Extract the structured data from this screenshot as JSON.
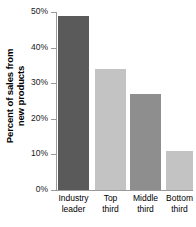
{
  "chart_data": {
    "type": "bar",
    "title": "",
    "subtitle": "",
    "xlabel": "",
    "ylabel": "Percent of sales from new products",
    "ylabel_lines": [
      "Percent of sales from",
      "new products"
    ],
    "categories": [
      "Industry leader",
      "Top third",
      "Middle third",
      "Bottom third"
    ],
    "category_lines": [
      [
        "Industry",
        "leader"
      ],
      [
        "Top",
        "third"
      ],
      [
        "Middle",
        "third"
      ],
      [
        "Bottom",
        "third"
      ]
    ],
    "values": [
      49,
      34,
      27,
      11
    ],
    "value_labels": [
      "49%",
      "34%",
      "27%",
      "11%"
    ],
    "ylim": [
      0,
      50
    ],
    "ytick_values": [
      0,
      10,
      20,
      30,
      40,
      50
    ],
    "ytick_labels": [
      "0%",
      "10%",
      "20%",
      "30%",
      "40%",
      "50%"
    ],
    "grid": false,
    "legend": null,
    "bar_colors": [
      "#5a5a5a",
      "#c3c3c3",
      "#8e8e8e",
      "#c3c3c3"
    ],
    "axis_color": "#9a9a9a",
    "background_color": "#ffffff",
    "text_color": "#000000"
  }
}
